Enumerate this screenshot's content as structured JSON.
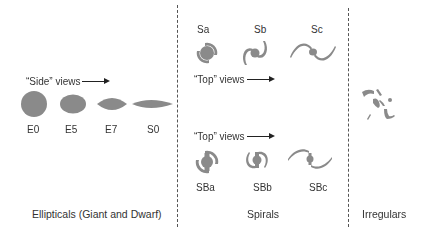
{
  "diagram": {
    "colors": {
      "galaxy_fill": "#8a8a8a",
      "text": "#333333",
      "divider": "#555555"
    },
    "ellipticals": {
      "category_label": "Ellipticals (Giant and Dwarf)",
      "views_label": "“Side” views",
      "items": [
        {
          "label": "E0",
          "shape": "circle"
        },
        {
          "label": "E5",
          "shape": "ellipse"
        },
        {
          "label": "E7",
          "shape": "lens"
        },
        {
          "label": "S0",
          "shape": "thin-lens"
        }
      ]
    },
    "spirals": {
      "category_label": "Spirals",
      "normal": {
        "views_label": "“Top” views",
        "items": [
          {
            "label": "Sa"
          },
          {
            "label": "Sb"
          },
          {
            "label": "Sc"
          }
        ]
      },
      "barred": {
        "views_label": "“Top” views",
        "items": [
          {
            "label": "SBa"
          },
          {
            "label": "SBb"
          },
          {
            "label": "SBc"
          }
        ]
      }
    },
    "irregulars": {
      "category_label": "Irregulars"
    }
  }
}
